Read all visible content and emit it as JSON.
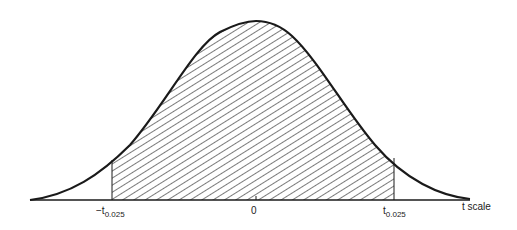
{
  "diagram": {
    "type": "t-distribution density curve with shaded central region",
    "shaded_region": "between -t_0.025 and t_0.025",
    "hatch_color": "#333333",
    "curve_color": "#1a1a1a"
  },
  "labels": {
    "neg_critical": {
      "main": "−t",
      "sub": "0.025"
    },
    "center": "0",
    "pos_critical": {
      "main": "t",
      "sub": "0.025"
    },
    "axis": "t  scale"
  }
}
